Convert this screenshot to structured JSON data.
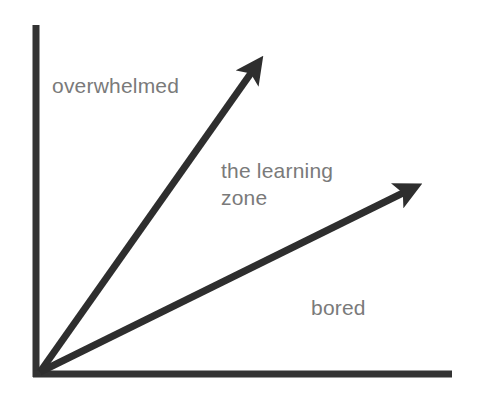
{
  "diagram": {
    "title": "",
    "labels": {
      "overwhelmed": "overwhelmed",
      "learning_zone_line1": "the learning",
      "learning_zone_line2": "zone",
      "bored": "bored"
    },
    "colors": {
      "axis": "#333333",
      "arrow": "#2e2e2e",
      "label_text": "#7a7a7a",
      "background": "#ffffff"
    },
    "axes": {
      "vertical": {
        "x": 36,
        "y_top": 25,
        "y_bottom": 377
      },
      "horizontal": {
        "y": 374,
        "x_left": 33,
        "x_right": 452
      }
    },
    "arrows": [
      {
        "name": "upper-boundary-arrow",
        "from": [
          40,
          372
        ],
        "to": [
          264,
          55
        ]
      },
      {
        "name": "lower-boundary-arrow",
        "from": [
          40,
          372
        ],
        "to": [
          423,
          183
        ]
      }
    ]
  }
}
